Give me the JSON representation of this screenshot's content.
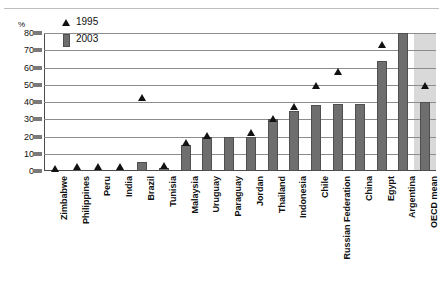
{
  "chart_data": {
    "type": "bar",
    "title": "",
    "subtitle": "",
    "xlabel": "",
    "ylabel": "%",
    "ylim": [
      0,
      80
    ],
    "yticks": [
      0,
      10,
      20,
      30,
      40,
      50,
      60,
      70,
      80
    ],
    "grid": true,
    "legend_position": "top-left",
    "legend": [
      "1995",
      "2003"
    ],
    "categories": [
      "Zimbabwe",
      "Philippines",
      "Peru",
      "India",
      "Brazil",
      "Tunisia",
      "Malaysia",
      "Uruguay",
      "Paraguay",
      "Jordan",
      "Thailand",
      "Indonesia",
      "Chile",
      "Russian Federation",
      "China",
      "Egypt",
      "Argentina",
      "OECD mean"
    ],
    "series": [
      {
        "name": "1995",
        "marker": "triangle",
        "color": "#111111",
        "values": [
          0,
          1,
          1,
          1,
          41,
          2,
          15,
          19,
          null,
          21,
          29,
          36,
          48,
          56,
          null,
          72,
          null,
          48
        ]
      },
      {
        "name": "2003",
        "marker": "bar",
        "color": "#6e6e6e",
        "values": [
          0,
          0,
          0,
          0,
          5,
          2,
          15,
          20,
          20,
          20,
          30,
          35,
          38,
          39,
          39,
          64,
          80,
          40
        ]
      }
    ],
    "highlight_band": {
      "category": "OECD mean",
      "color": "#d9d9d9"
    }
  }
}
